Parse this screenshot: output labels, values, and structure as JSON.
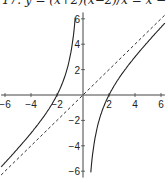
{
  "chart_data": {
    "type": "line",
    "title": "17. y = (x+2)(x−2)/x = x − 4/x",
    "xlabel": "",
    "ylabel": "",
    "xlim": [
      -6.3,
      6.3
    ],
    "ylim": [
      -6.5,
      6.5
    ],
    "x_ticks": [
      -6,
      -4,
      -2,
      2,
      4,
      6
    ],
    "y_ticks": [
      -6,
      -4,
      -2,
      2,
      4,
      6
    ],
    "grid": false,
    "legend": null,
    "series": [
      {
        "name": "y = x - 4/x (left branch)",
        "style": "solid",
        "x": [
          -6,
          -5,
          -4,
          -3,
          -2,
          -1.5,
          -1,
          -0.8,
          -0.65
        ],
        "y": [
          -5.33,
          -4.2,
          -3,
          -1.67,
          0,
          1.17,
          3,
          4.2,
          5.5
        ]
      },
      {
        "name": "y = x - 4/x (right branch)",
        "style": "solid",
        "x": [
          0.65,
          0.8,
          1,
          1.5,
          2,
          3,
          4,
          5,
          6
        ],
        "y": [
          -5.5,
          -4.2,
          -3,
          -1.17,
          0,
          1.67,
          3,
          4.2,
          5.33
        ]
      },
      {
        "name": "asymptote y = x",
        "style": "dashed",
        "x": [
          -6.3,
          6.3
        ],
        "y": [
          -6.3,
          6.3
        ]
      }
    ],
    "annotations": [
      "vertical asymptote x = 0",
      "slant asymptote y = x"
    ]
  }
}
